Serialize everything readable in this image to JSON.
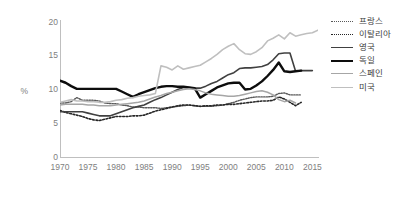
{
  "chart_data": {
    "type": "line",
    "title": "",
    "xlabel": "",
    "ylabel": "%",
    "xlim": [
      1970,
      2016
    ],
    "ylim": [
      0,
      20
    ],
    "ytick_values": [
      0,
      5,
      10,
      15,
      20
    ],
    "ytick_labels": [
      "0",
      "5",
      "10",
      "15",
      "20"
    ],
    "xtick_values": [
      1970,
      1975,
      1980,
      1985,
      1990,
      1995,
      2000,
      2005,
      2010,
      2015
    ],
    "xtick_labels": [
      "1970",
      "1975",
      "1980",
      "1985",
      "1990",
      "1995",
      "2000",
      "2005",
      "2010",
      "2015"
    ],
    "grid": false,
    "legend_position": "right",
    "x": [
      1970,
      1971,
      1972,
      1973,
      1974,
      1975,
      1976,
      1977,
      1978,
      1979,
      1980,
      1981,
      1982,
      1983,
      1984,
      1985,
      1986,
      1987,
      1988,
      1989,
      1990,
      1991,
      1992,
      1993,
      1994,
      1995,
      1996,
      1997,
      1998,
      1999,
      2000,
      2001,
      2002,
      2003,
      2004,
      2005,
      2006,
      2007,
      2008,
      2009,
      2010,
      2011,
      2012,
      2013,
      2014,
      2015,
      2016
    ],
    "series": [
      {
        "name": "프랑스",
        "style": "fine-dotted",
        "color": "#595959",
        "width": 1.4,
        "values": [
          8.0,
          8.0,
          8.2,
          8.8,
          8.4,
          8.4,
          8.4,
          8.3,
          8.0,
          7.9,
          7.9,
          7.7,
          7.6,
          7.4,
          7.4,
          7.3,
          7.3,
          7.3,
          7.2,
          7.3,
          7.4,
          7.5,
          7.6,
          7.7,
          7.6,
          7.5,
          7.5,
          7.5,
          7.6,
          7.7,
          7.9,
          8.1,
          8.4,
          8.6,
          8.8,
          8.9,
          8.9,
          8.9,
          9.0,
          9.4,
          9.5,
          9.2,
          9.2,
          9.2,
          null,
          null,
          null
        ]
      },
      {
        "name": "이탈리아",
        "style": "coarse-dotted",
        "color": "#262626",
        "width": 1.6,
        "values": [
          6.9,
          6.6,
          6.4,
          6.2,
          6.0,
          5.7,
          5.5,
          5.4,
          5.6,
          5.8,
          6.0,
          6.0,
          6.0,
          6.1,
          6.1,
          6.2,
          6.5,
          6.8,
          7.0,
          7.2,
          7.4,
          7.6,
          7.7,
          7.7,
          7.6,
          7.5,
          7.6,
          7.6,
          7.7,
          7.7,
          7.8,
          7.8,
          7.9,
          8.0,
          8.1,
          8.2,
          8.3,
          8.3,
          8.4,
          8.9,
          8.6,
          8.1,
          7.6,
          8.1,
          null,
          null,
          null
        ]
      },
      {
        "name": "영국",
        "style": "solid",
        "color": "#404040",
        "width": 1.6,
        "values": [
          6.7,
          6.7,
          6.7,
          6.7,
          6.7,
          6.5,
          6.3,
          6.1,
          6.1,
          6.1,
          6.4,
          6.7,
          7.0,
          7.3,
          7.5,
          7.7,
          8.1,
          8.5,
          8.8,
          9.2,
          9.6,
          10.0,
          10.3,
          10.3,
          10.2,
          10.2,
          10.5,
          10.9,
          11.2,
          11.7,
          12.2,
          12.5,
          13.1,
          13.2,
          13.2,
          13.3,
          13.4,
          13.7,
          14.4,
          15.3,
          15.4,
          15.4,
          12.7,
          12.8,
          12.8,
          12.8,
          null
        ]
      },
      {
        "name": "독일",
        "style": "solid",
        "color": "#0d0d0d",
        "width": 2.4,
        "values": [
          11.3,
          11.0,
          10.5,
          10.1,
          10.1,
          10.1,
          10.1,
          10.1,
          10.1,
          10.1,
          10.1,
          9.7,
          9.3,
          8.9,
          9.3,
          9.6,
          9.9,
          10.2,
          10.4,
          10.5,
          10.5,
          10.4,
          10.4,
          10.3,
          10.2,
          8.8,
          9.3,
          9.8,
          10.3,
          10.6,
          10.9,
          11.0,
          11.0,
          10.0,
          10.1,
          10.6,
          11.2,
          12.0,
          12.9,
          14.0,
          12.7,
          12.6,
          12.7,
          12.8,
          null,
          null,
          null
        ]
      },
      {
        "name": "스페인",
        "style": "solid",
        "color": "#a6a6a6",
        "width": 1.5,
        "values": [
          7.7,
          7.8,
          7.8,
          7.8,
          7.8,
          7.7,
          7.7,
          7.6,
          7.6,
          7.6,
          7.7,
          7.8,
          7.9,
          8.0,
          8.1,
          8.3,
          8.6,
          8.9,
          9.1,
          9.4,
          9.6,
          9.8,
          10.0,
          10.1,
          10.0,
          9.8,
          9.5,
          9.3,
          9.2,
          9.1,
          9.0,
          9.0,
          9.1,
          9.3,
          9.5,
          9.7,
          9.8,
          9.6,
          9.2,
          8.5,
          8.2,
          8.4,
          8.0,
          null,
          null,
          null,
          null
        ]
      },
      {
        "name": "미국",
        "style": "solid",
        "color": "#bfbfbf",
        "width": 1.6,
        "values": [
          8.1,
          8.3,
          8.5,
          8.3,
          8.3,
          8.2,
          8.2,
          8.1,
          8.1,
          8.2,
          8.4,
          8.5,
          8.7,
          8.8,
          9.0,
          9.1,
          9.2,
          9.4,
          13.5,
          13.3,
          12.9,
          13.5,
          13.0,
          13.2,
          13.4,
          13.6,
          14.1,
          14.6,
          15.2,
          15.9,
          16.4,
          16.8,
          15.9,
          15.3,
          15.2,
          15.6,
          16.2,
          17.2,
          17.6,
          18.1,
          17.5,
          18.4,
          17.9,
          18.1,
          18.3,
          18.4,
          18.8
        ]
      }
    ]
  },
  "legend": {
    "items": [
      {
        "label": "프랑스"
      },
      {
        "label": "이탈리아"
      },
      {
        "label": "영국"
      },
      {
        "label": "독일"
      },
      {
        "label": "스페인"
      },
      {
        "label": "미국"
      }
    ]
  }
}
